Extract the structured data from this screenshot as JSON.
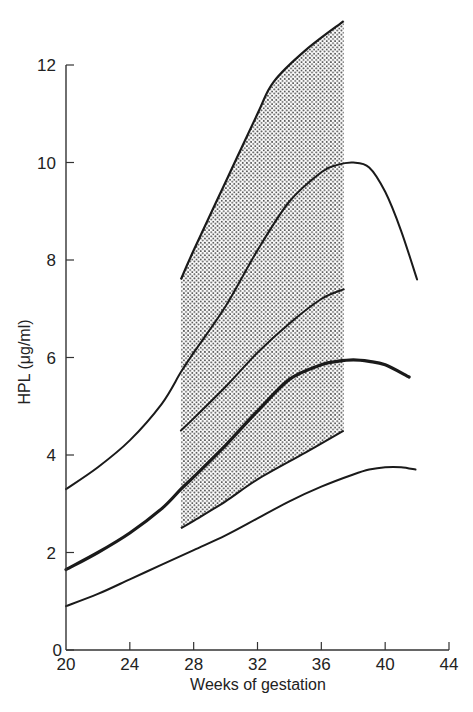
{
  "chart_data": {
    "type": "line",
    "title": "",
    "xlabel": "Weeks of gestation",
    "ylabel": "HPL (μg/ml)",
    "xlim": [
      20,
      44
    ],
    "ylim": [
      0,
      12
    ],
    "x_ticks": [
      20,
      24,
      28,
      32,
      36,
      40,
      44
    ],
    "y_ticks": [
      0,
      2,
      4,
      6,
      8,
      10,
      12
    ],
    "grid": false,
    "legend": null,
    "series": [
      {
        "name": "upper outer curve",
        "style": "thin",
        "x": [
          20,
          22,
          24,
          26,
          27.2,
          28,
          30,
          32,
          34,
          36,
          37,
          38,
          39,
          40,
          41,
          42
        ],
        "values": [
          3.3,
          3.75,
          4.3,
          5.05,
          5.7,
          6.1,
          7.05,
          8.2,
          9.2,
          9.8,
          9.95,
          10.0,
          9.9,
          9.4,
          8.6,
          7.6
        ]
      },
      {
        "name": "median curve",
        "style": "thick",
        "x": [
          20,
          22,
          24,
          26,
          27.2,
          28,
          30,
          32,
          34,
          36,
          37,
          38,
          39,
          40,
          41.5
        ],
        "values": [
          1.65,
          2.0,
          2.4,
          2.9,
          3.3,
          3.55,
          4.2,
          4.9,
          5.55,
          5.85,
          5.92,
          5.95,
          5.92,
          5.85,
          5.6
        ]
      },
      {
        "name": "lower outer curve",
        "style": "thin",
        "x": [
          20,
          22,
          24,
          26,
          28,
          30,
          32,
          34,
          36,
          38,
          39,
          40,
          41,
          41.9
        ],
        "values": [
          0.9,
          1.15,
          1.45,
          1.75,
          2.05,
          2.35,
          2.7,
          3.05,
          3.35,
          3.6,
          3.7,
          3.75,
          3.75,
          3.7
        ]
      },
      {
        "name": "inner upper curve (within band)",
        "style": "thin",
        "x": [
          27.2,
          28,
          30,
          32,
          34,
          36,
          37.4
        ],
        "values": [
          4.5,
          4.75,
          5.4,
          6.1,
          6.7,
          7.2,
          7.4
        ]
      }
    ],
    "shaded_band": {
      "x_range": [
        27.2,
        37.4
      ],
      "upper_edge": {
        "x": [
          27.2,
          28,
          30,
          32,
          33,
          35,
          37.4
        ],
        "values": [
          7.6,
          8.2,
          9.6,
          11.0,
          11.65,
          12.3,
          12.9
        ]
      },
      "lower_edge": {
        "x": [
          27.2,
          28,
          30,
          32,
          35,
          37.4
        ],
        "values": [
          2.5,
          2.65,
          3.05,
          3.5,
          4.05,
          4.5
        ]
      },
      "fill": "stippled"
    }
  },
  "colors": {
    "line": "#1a1a1a",
    "axis": "#333333",
    "text": "#222222",
    "stipple_dot": "#555555",
    "background": "#ffffff"
  }
}
